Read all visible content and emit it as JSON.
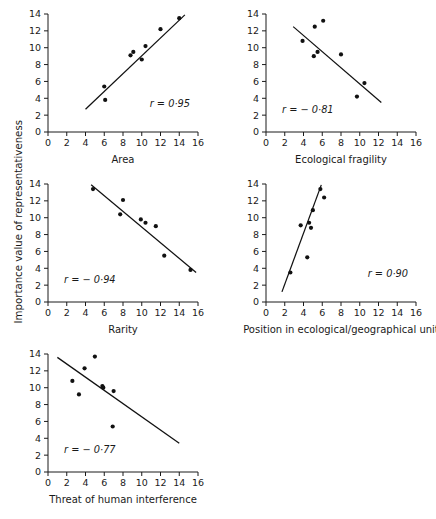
{
  "figure": {
    "y_axis_label": "Importance value of representativeness",
    "panel_count": 5
  },
  "chart_data": [
    {
      "type": "scatter",
      "title": "",
      "xlabel": "Area",
      "ylabel": "Importance value of representativeness",
      "xlim": [
        0,
        16
      ],
      "ylim": [
        0,
        14
      ],
      "xticks": [
        0,
        2,
        4,
        6,
        8,
        10,
        12,
        14,
        16
      ],
      "yticks": [
        0,
        2,
        4,
        6,
        8,
        10,
        12,
        14
      ],
      "grid": false,
      "annotation": "r = 0·95",
      "r": 0.95,
      "points": [
        {
          "x": 6.0,
          "y": 5.4
        },
        {
          "x": 6.1,
          "y": 3.8
        },
        {
          "x": 8.8,
          "y": 9.1
        },
        {
          "x": 9.1,
          "y": 9.5
        },
        {
          "x": 10.0,
          "y": 8.6
        },
        {
          "x": 10.4,
          "y": 10.2
        },
        {
          "x": 12.0,
          "y": 12.2
        },
        {
          "x": 14.0,
          "y": 13.5
        }
      ],
      "fit_line": {
        "x1": 4.0,
        "y1": 2.7,
        "x2": 14.6,
        "y2": 13.9
      }
    },
    {
      "type": "scatter",
      "title": "",
      "xlabel": "Ecological fragility",
      "ylabel": "Importance value of representativeness",
      "xlim": [
        0,
        16
      ],
      "ylim": [
        0,
        14
      ],
      "xticks": [
        0,
        2,
        4,
        6,
        8,
        10,
        12,
        14,
        16
      ],
      "yticks": [
        0,
        2,
        4,
        6,
        8,
        10,
        12,
        14
      ],
      "grid": false,
      "annotation": "r = − 0·81",
      "r": -0.81,
      "points": [
        {
          "x": 3.9,
          "y": 10.8
        },
        {
          "x": 5.2,
          "y": 12.5
        },
        {
          "x": 6.1,
          "y": 13.2
        },
        {
          "x": 5.1,
          "y": 9.0
        },
        {
          "x": 5.5,
          "y": 9.5
        },
        {
          "x": 8.0,
          "y": 9.2
        },
        {
          "x": 9.7,
          "y": 4.2
        },
        {
          "x": 10.5,
          "y": 5.8
        }
      ],
      "fit_line": {
        "x1": 2.9,
        "y1": 12.5,
        "x2": 12.3,
        "y2": 3.5
      }
    },
    {
      "type": "scatter",
      "title": "",
      "xlabel": "Rarity",
      "ylabel": "Importance value of representativeness",
      "xlim": [
        0,
        16
      ],
      "ylim": [
        0,
        14
      ],
      "xticks": [
        0,
        2,
        4,
        6,
        8,
        10,
        12,
        14,
        16
      ],
      "yticks": [
        0,
        2,
        4,
        6,
        8,
        10,
        12,
        14
      ],
      "grid": false,
      "annotation": "r = − 0·94",
      "r": -0.94,
      "points": [
        {
          "x": 4.8,
          "y": 13.4
        },
        {
          "x": 8.0,
          "y": 12.1
        },
        {
          "x": 7.7,
          "y": 10.4
        },
        {
          "x": 9.9,
          "y": 9.8
        },
        {
          "x": 10.4,
          "y": 9.4
        },
        {
          "x": 11.5,
          "y": 9.0
        },
        {
          "x": 12.4,
          "y": 5.5
        },
        {
          "x": 15.2,
          "y": 3.8
        }
      ],
      "fit_line": {
        "x1": 4.6,
        "y1": 13.9,
        "x2": 15.8,
        "y2": 3.5
      }
    },
    {
      "type": "scatter",
      "title": "",
      "xlabel": "Position in ecological/geographical unit",
      "ylabel": "Importance value of representativeness",
      "xlim": [
        0,
        16
      ],
      "ylim": [
        0,
        14
      ],
      "xticks": [
        0,
        2,
        4,
        6,
        8,
        10,
        12,
        14,
        16
      ],
      "yticks": [
        0,
        2,
        4,
        6,
        8,
        10,
        12,
        14
      ],
      "grid": false,
      "annotation": "r = 0·90",
      "r": 0.9,
      "points": [
        {
          "x": 2.6,
          "y": 3.5
        },
        {
          "x": 3.7,
          "y": 9.1
        },
        {
          "x": 4.4,
          "y": 5.3
        },
        {
          "x": 4.6,
          "y": 9.4
        },
        {
          "x": 4.8,
          "y": 8.8
        },
        {
          "x": 5.0,
          "y": 10.9
        },
        {
          "x": 5.8,
          "y": 13.4
        },
        {
          "x": 6.2,
          "y": 12.4
        }
      ],
      "fit_line": {
        "x1": 1.7,
        "y1": 1.2,
        "x2": 5.9,
        "y2": 13.9
      }
    },
    {
      "type": "scatter",
      "title": "",
      "xlabel": "Threat of human interference",
      "ylabel": "Importance value of representativeness",
      "xlim": [
        0,
        16
      ],
      "ylim": [
        0,
        14
      ],
      "xticks": [
        0,
        2,
        4,
        6,
        8,
        10,
        12,
        14,
        16
      ],
      "yticks": [
        0,
        2,
        4,
        6,
        8,
        10,
        12,
        14
      ],
      "grid": false,
      "annotation": "r = − 0·77",
      "r": -0.77,
      "points": [
        {
          "x": 2.6,
          "y": 10.8
        },
        {
          "x": 3.3,
          "y": 9.2
        },
        {
          "x": 3.9,
          "y": 12.3
        },
        {
          "x": 5.0,
          "y": 13.7
        },
        {
          "x": 5.8,
          "y": 10.2
        },
        {
          "x": 5.9,
          "y": 10.0
        },
        {
          "x": 7.0,
          "y": 9.6
        },
        {
          "x": 6.9,
          "y": 5.4
        }
      ],
      "fit_line": {
        "x1": 1.0,
        "y1": 13.6,
        "x2": 14.0,
        "y2": 3.4
      }
    }
  ]
}
